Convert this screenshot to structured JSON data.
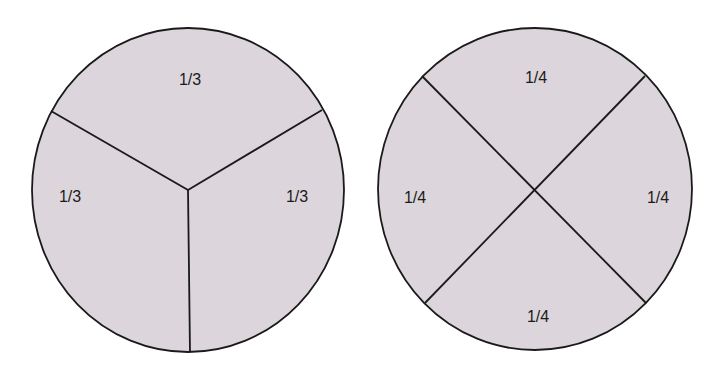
{
  "colors": {
    "fill": "#dcd5db",
    "stroke": "#1a1a1a",
    "background": "#ffffff"
  },
  "diagrams": [
    {
      "name": "thirds",
      "labels": {
        "top": "1/3",
        "left": "1/3",
        "right": "1/3"
      }
    },
    {
      "name": "quarters",
      "labels": {
        "top": "1/4",
        "left": "1/4",
        "right": "1/4",
        "bottom": "1/4"
      }
    }
  ]
}
